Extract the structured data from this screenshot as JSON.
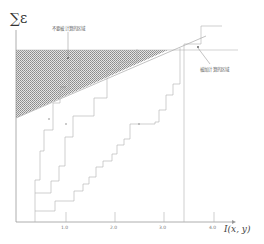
{
  "figure": {
    "y_axis_label": "∑ε",
    "x_axis_label": "I(x, y)",
    "annotations": {
      "top_region": "不要被计算的区域",
      "right_region": "被加计算的区域"
    },
    "curve_labels": [
      "s",
      "g",
      "c"
    ],
    "x_ticks": [
      "1.0",
      "2.0",
      "3.0",
      "4.0"
    ],
    "colors": {
      "axis": "#9a9a9a",
      "curve": "#b0b0b0",
      "hatch": "#7a7a7a"
    }
  }
}
